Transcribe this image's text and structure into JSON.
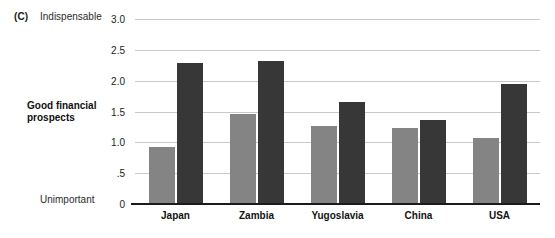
{
  "figure": {
    "panel_letter": "(C)",
    "row_title": "Good financial prospects",
    "scale_top_anchor": "Indispensable",
    "scale_bottom_anchor": "Unimportant"
  },
  "colors": {
    "series_a": "#848484",
    "series_b": "#373737",
    "gridline": "#c9c9c9",
    "axis": "#1b1b1b",
    "background": "#ffffff"
  },
  "chart_data": {
    "type": "bar",
    "title": "Good financial prospects",
    "xlabel": "",
    "ylabel": "",
    "ylim": [
      0,
      3.0
    ],
    "grid": true,
    "legend_position": "none",
    "categories": [
      "Japan",
      "Zambia",
      "Yugoslavia",
      "China",
      "USA"
    ],
    "ytick_labels": [
      "0",
      ".5",
      "1.0",
      "1.5",
      "2.0",
      "2.5",
      "3.0"
    ],
    "ytick_values": [
      0,
      0.5,
      1.0,
      1.5,
      2.0,
      2.5,
      3.0
    ],
    "axis_anchor_high": "Indispensable",
    "axis_anchor_low": "Unimportant",
    "series": [
      {
        "name": "series_a",
        "color": "#848484",
        "values": [
          0.92,
          1.46,
          1.26,
          1.23,
          1.07
        ]
      },
      {
        "name": "series_b",
        "color": "#373737",
        "values": [
          2.29,
          2.32,
          1.65,
          1.36,
          1.94
        ]
      }
    ]
  }
}
